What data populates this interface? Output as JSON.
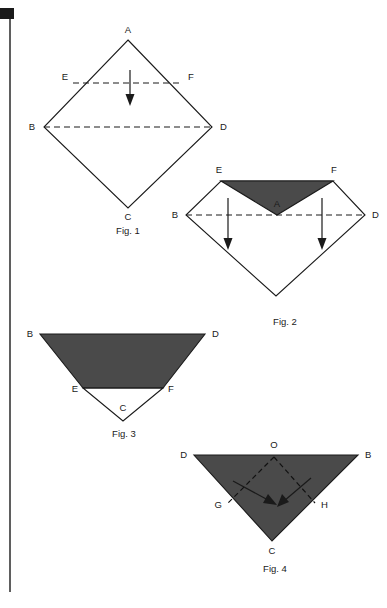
{
  "document": {
    "type": "patent-style folding diagram",
    "background_color": "#ffffff",
    "ink_color": "#1a1a1a",
    "shaded_face_color": "#4a4a4a",
    "page_width": 387,
    "page_height": 608
  },
  "figures": [
    {
      "id": "fig1",
      "caption": "Fig. 1",
      "caption_x": 128,
      "caption_y": 234,
      "description": "Open square sheet rotated 45 degrees forming a diamond with apex A on top, B at left, C at bottom, D at right. A dashed horizontal crease EF crosses the upper half and a dashed horizontal crease BD crosses the middle. A downward arrow indicates folding apex A down.",
      "vertices": [
        {
          "name": "A",
          "x": 128,
          "y": 40,
          "label_x": 128,
          "label_y": 33,
          "anchor": "middle"
        },
        {
          "name": "B",
          "x": 44,
          "y": 127,
          "label_x": 35,
          "label_y": 130,
          "anchor": "end"
        },
        {
          "name": "C",
          "x": 128,
          "y": 208,
          "label_x": 128,
          "label_y": 220,
          "anchor": "middle"
        },
        {
          "name": "D",
          "x": 212,
          "y": 127,
          "label_x": 220,
          "label_y": 130,
          "anchor": "start"
        },
        {
          "name": "E",
          "x": 73,
          "y": 83,
          "label_x": 68,
          "label_y": 80,
          "anchor": "end"
        },
        {
          "name": "F",
          "x": 183,
          "y": 83,
          "label_x": 188,
          "label_y": 80,
          "anchor": "start"
        }
      ],
      "outline": "128,40 212,127 128,208 44,127",
      "creases": [
        {
          "name": "crease-EF",
          "x1": 73,
          "y1": 83,
          "x2": 183,
          "y2": 83
        },
        {
          "name": "crease-BD",
          "x1": 44,
          "y1": 127,
          "x2": 212,
          "y2": 127
        }
      ],
      "arrows": [
        {
          "name": "fold-arrow-down",
          "x1": 130,
          "y1": 70,
          "x2": 130,
          "y2": 104,
          "direction": "down"
        }
      ]
    },
    {
      "id": "fig2",
      "caption": "Fig. 2",
      "caption_x": 285,
      "caption_y": 325,
      "description": "Apex A folded down along crease EF producing a shaded inverted triangle E-F-A. Outline retains B at left, D at right and bottom point C. A dashed crease runs from B to D and two downward arrows indicate folding the left and right flaps down.",
      "vertices": [
        {
          "name": "E",
          "x": 221,
          "y": 181,
          "label_x": 219,
          "label_y": 173,
          "anchor": "middle"
        },
        {
          "name": "F",
          "x": 333,
          "y": 181,
          "label_x": 334,
          "label_y": 173,
          "anchor": "middle"
        },
        {
          "name": "A",
          "x": 277,
          "y": 215,
          "label_x": 277,
          "label_y": 207,
          "anchor": "middle"
        },
        {
          "name": "B",
          "x": 186,
          "y": 215,
          "label_x": 178,
          "label_y": 218,
          "anchor": "end"
        },
        {
          "name": "D",
          "x": 365,
          "y": 215,
          "label_x": 372,
          "label_y": 218,
          "anchor": "start"
        }
      ],
      "outline": "221,181 333,181 365,215 276,296 186,215",
      "shaded_face": "221,181 333,181 277,215",
      "creases": [
        {
          "name": "crease-BD",
          "x1": 186,
          "y1": 215,
          "x2": 365,
          "y2": 215
        }
      ],
      "arrows": [
        {
          "name": "fold-arrow-left-down",
          "x1": 228,
          "y1": 198,
          "x2": 228,
          "y2": 248,
          "direction": "down"
        },
        {
          "name": "fold-arrow-right-down",
          "x1": 322,
          "y1": 198,
          "x2": 322,
          "y2": 248,
          "direction": "down"
        }
      ]
    },
    {
      "id": "fig3",
      "caption": "Fig.  3",
      "caption_x": 124,
      "caption_y": 437,
      "description": "Result after folding: a shaded trapezoid B-D-F-E with a white triangle E-F-C below it, point C at the bottom.",
      "vertices": [
        {
          "name": "B",
          "x": 40,
          "y": 334,
          "label_x": 33,
          "label_y": 337,
          "anchor": "end"
        },
        {
          "name": "D",
          "x": 205,
          "y": 334,
          "label_x": 212,
          "label_y": 337,
          "anchor": "start"
        },
        {
          "name": "E",
          "x": 83,
          "y": 388,
          "label_x": 78,
          "label_y": 392,
          "anchor": "end"
        },
        {
          "name": "F",
          "x": 163,
          "y": 388,
          "label_x": 168,
          "label_y": 392,
          "anchor": "start"
        },
        {
          "name": "C",
          "x": 123,
          "y": 421,
          "label_x": 123,
          "label_y": 411,
          "anchor": "middle"
        }
      ],
      "shaded_face": "40,334 205,334 163,388 83,388",
      "white_face": "83,388 163,388 123,421",
      "outline": "40,334 205,334 123,421"
    },
    {
      "id": "fig4",
      "caption": "Fig.  4",
      "caption_x": 275,
      "caption_y": 572,
      "description": "Shaded downward-pointing triangle D-B-C with apex O at the top centre. Dashed creases run from O down to G on the left edge and H on the right edge. Two arrows point inward and downward toward the centre indicating the flaps fold in.",
      "vertices": [
        {
          "name": "D",
          "x": 194,
          "y": 455,
          "label_x": 187,
          "label_y": 458,
          "anchor": "end"
        },
        {
          "name": "B",
          "x": 358,
          "y": 455,
          "label_x": 365,
          "label_y": 458,
          "anchor": "start"
        },
        {
          "name": "O",
          "x": 274,
          "y": 455,
          "label_x": 274,
          "label_y": 448,
          "anchor": "middle"
        },
        {
          "name": "G",
          "x": 228,
          "y": 503,
          "label_x": 222,
          "label_y": 508,
          "anchor": "end"
        },
        {
          "name": "H",
          "x": 315,
          "y": 503,
          "label_x": 321,
          "label_y": 508,
          "anchor": "start"
        },
        {
          "name": "C",
          "x": 272,
          "y": 541,
          "label_x": 272,
          "label_y": 554,
          "anchor": "middle"
        }
      ],
      "shaded_face": "194,455 358,455 272,541",
      "creases": [
        {
          "name": "crease-OG",
          "x1": 274,
          "y1": 457,
          "x2": 228,
          "y2": 503
        },
        {
          "name": "crease-OH",
          "x1": 274,
          "y1": 457,
          "x2": 315,
          "y2": 503
        }
      ],
      "arrows": [
        {
          "name": "fold-arrow-left-inward",
          "x1": 233,
          "y1": 481,
          "x2": 274,
          "y2": 504,
          "direction": "down-right"
        },
        {
          "name": "fold-arrow-right-inward",
          "x1": 311,
          "y1": 478,
          "x2": 280,
          "y2": 505,
          "direction": "down-left"
        }
      ]
    }
  ],
  "page_border": {
    "name": "left-rule",
    "description": "A thin vertical rule near the left edge of the page with a small black corner mark at the top.",
    "x": 10,
    "y_top": 18,
    "y_bottom": 592,
    "corner_mark": {
      "x": 0,
      "y": 8,
      "width": 14,
      "height": 11
    }
  }
}
